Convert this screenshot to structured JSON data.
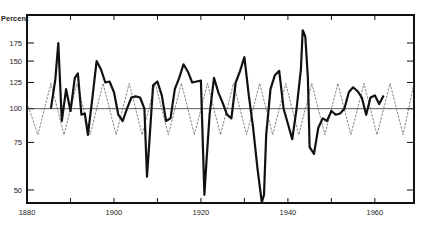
{
  "chart_data": {
    "type": "line",
    "title": "",
    "ylabel": "Percent",
    "xlabel": "",
    "yscale": "log",
    "ylim": [
      46,
      195
    ],
    "xlim": [
      1880,
      1969
    ],
    "grid": false,
    "legend": null,
    "reference_line": {
      "y": 100
    },
    "x_ticks": [
      1880,
      1890,
      1900,
      1910,
      1920,
      1930,
      1940,
      1950,
      1960
    ],
    "x_tick_labels": [
      "1880",
      "1900",
      "1920",
      "1940",
      "1960"
    ],
    "y_ticks": [
      50,
      75,
      100,
      125,
      150,
      175
    ],
    "y_tick_labels": [
      "50",
      "75",
      "100",
      "125",
      "150",
      "175"
    ],
    "series": [
      {
        "name": "observed",
        "style": "solid-thick",
        "x": [
          1885.5,
          1886.5,
          1887.2,
          1888,
          1889,
          1890,
          1891,
          1891.7,
          1892.5,
          1893.3,
          1894,
          1895,
          1896,
          1897,
          1898,
          1899,
          1900,
          1901,
          1902,
          1903,
          1904,
          1905,
          1906,
          1907,
          1907.6,
          1908,
          1909,
          1910,
          1911,
          1912,
          1913,
          1914,
          1915,
          1916,
          1917,
          1918,
          1919,
          1920,
          1920.8,
          1921.3,
          1922,
          1923,
          1924,
          1925,
          1926,
          1927,
          1928,
          1929,
          1930,
          1931,
          1932,
          1933,
          1934,
          1934.5,
          1935,
          1936,
          1937,
          1938,
          1939,
          1940,
          1941,
          1942,
          1943,
          1943.4,
          1944,
          1944.6,
          1945,
          1946,
          1947,
          1948,
          1949,
          1950,
          1951,
          1952,
          1953,
          1954,
          1955,
          1956,
          1957,
          1958,
          1959,
          1960,
          1961,
          1962
        ],
        "values": [
          100,
          128,
          175,
          90,
          118,
          98,
          130,
          135,
          95,
          96,
          80,
          108,
          150,
          140,
          125,
          126,
          115,
          95,
          90,
          100,
          110,
          111,
          110,
          100,
          56,
          70,
          122,
          126,
          112,
          90,
          92,
          118,
          130,
          146,
          137,
          125,
          126,
          127,
          48,
          65,
          95,
          130,
          115,
          105,
          95,
          92,
          125,
          138,
          155,
          112,
          85,
          60,
          45,
          48,
          80,
          118,
          133,
          138,
          100,
          88,
          77,
          100,
          140,
          195,
          185,
          130,
          72,
          68,
          85,
          92,
          90,
          98,
          95,
          96,
          100,
          115,
          120,
          116,
          110,
          95,
          110,
          112,
          104,
          112
        ]
      },
      {
        "name": "cycle",
        "style": "dashed-thin",
        "x": [
          1880,
          1882.5,
          1885.5,
          1888.5,
          1891.5,
          1894.5,
          1897.5,
          1900.5,
          1903.5,
          1906.5,
          1909.5,
          1912.5,
          1915.5,
          1918.5,
          1921.5,
          1924.5,
          1927.5,
          1930.5,
          1933.5,
          1936.5,
          1939.5,
          1942.5,
          1945.5,
          1948.5,
          1951.5,
          1954.5,
          1957.5,
          1960.5,
          1963.5,
          1966.5,
          1969
        ],
        "values": [
          105,
          80,
          124,
          80,
          124,
          80,
          124,
          80,
          124,
          80,
          124,
          80,
          124,
          80,
          124,
          80,
          124,
          80,
          124,
          80,
          124,
          80,
          124,
          80,
          124,
          80,
          124,
          80,
          124,
          80,
          124
        ]
      }
    ]
  },
  "plot": {
    "x_px_range": [
      27,
      414
    ],
    "y_px_range": [
      15,
      203
    ],
    "colors": {
      "line": "#111111",
      "dashed": "#555555",
      "frame": "#111111",
      "ref": "#333333"
    }
  }
}
